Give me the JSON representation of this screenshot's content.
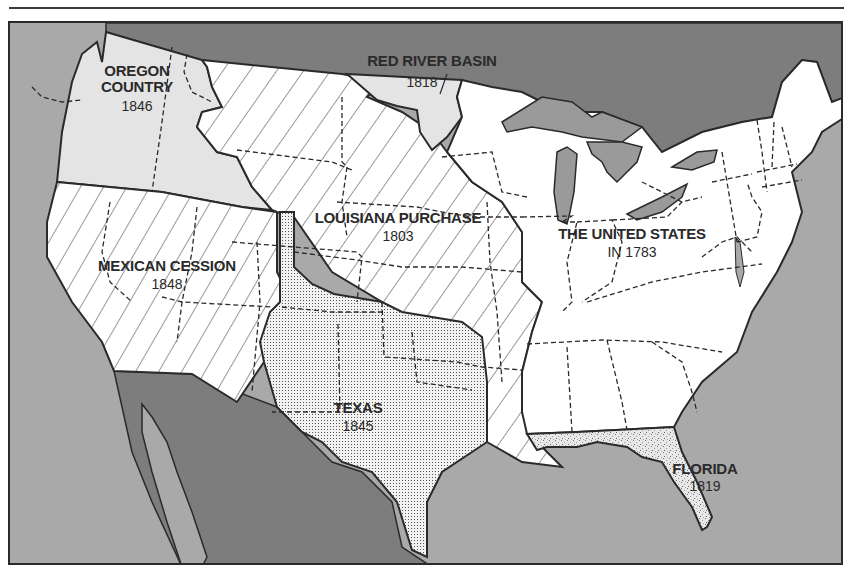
{
  "map": {
    "title": "Territorial Growth of the United States",
    "colors": {
      "ocean": "#a9a9a9",
      "foreign_land": "#7d7d7d",
      "great_lakes": "#9a9a9a",
      "oregon": "#e4e4e4",
      "us_1783": "#ffffff",
      "border": "#2a2a2a"
    },
    "regions": [
      {
        "id": "oregon",
        "name": "OREGON\nCOUNTRY",
        "name_line1": "OREGON",
        "name_line2": "COUNTRY",
        "year": "1846",
        "fill": "light-gray"
      },
      {
        "id": "red-river",
        "name": "RED RIVER BASIN",
        "year": "1818",
        "fill": "light-gray"
      },
      {
        "id": "louisiana",
        "name": "LOUISIANA PURCHASE",
        "year": "1803",
        "fill": "diagonal-hatch-down"
      },
      {
        "id": "mexican-cession",
        "name": "MEXICAN CESSION",
        "year": "1848",
        "fill": "diagonal-hatch-up"
      },
      {
        "id": "texas",
        "name": "TEXAS",
        "year": "1845",
        "fill": "dot-grid"
      },
      {
        "id": "us-1783",
        "name": "THE UNITED STATES",
        "year": "IN 1783",
        "fill": "white"
      },
      {
        "id": "florida",
        "name": "FLORIDA",
        "year": "1819",
        "fill": "speckled"
      }
    ]
  }
}
